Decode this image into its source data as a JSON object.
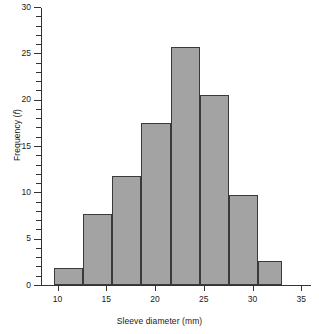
{
  "chart_data": {
    "type": "bar",
    "title": "",
    "xlabel": "Sleeve diameter (mm)",
    "ylabel": "Frequency (f)",
    "ylabel_prefix": "Frequency (",
    "ylabel_symbol": "f",
    "ylabel_suffix": ")",
    "xlim": [
      8.3,
      36.0
    ],
    "ylim": [
      0,
      30
    ],
    "grid": false,
    "legend": null,
    "bar_fill_color": "#a3a3a3",
    "bar_edge_color": "#3a3a3a",
    "axis_color": "#333333",
    "bin_edges": [
      9.6,
      12.6,
      15.6,
      18.6,
      21.6,
      24.6,
      27.6,
      30.6,
      33.0
    ],
    "categories": [
      "9.6-12.6",
      "12.6-15.6",
      "15.6-18.6",
      "18.6-21.6",
      "21.6-24.6",
      "24.6-27.6",
      "27.6-30.6",
      "30.6-33.0"
    ],
    "values": [
      1.8,
      7.7,
      11.8,
      17.5,
      25.7,
      20.5,
      9.7,
      2.6
    ],
    "x_ticks_major": [
      10,
      15,
      20,
      25,
      30,
      35
    ],
    "x_tick_labels": [
      "10",
      "15",
      "20",
      "25",
      "30",
      "35"
    ],
    "y_ticks_major": [
      0,
      5,
      10,
      15,
      20,
      25,
      30
    ],
    "y_tick_labels": [
      "0",
      "5",
      "10",
      "15",
      "20",
      "25",
      "30"
    ],
    "y_ticks_minor": [
      1,
      2,
      3,
      4,
      6,
      7,
      8,
      9,
      11,
      12,
      13,
      14,
      16,
      17,
      18,
      19,
      21,
      22,
      23,
      24,
      26,
      27,
      28,
      29
    ]
  }
}
